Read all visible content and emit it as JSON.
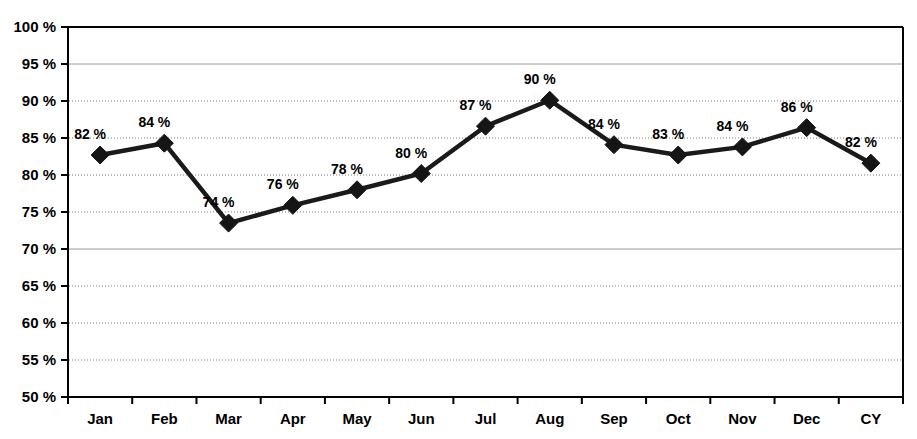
{
  "chart_data": {
    "type": "line",
    "title": "",
    "xlabel": "",
    "ylabel": "",
    "categories": [
      "Jan",
      "Feb",
      "Mar",
      "Apr",
      "May",
      "Jun",
      "Jul",
      "Aug",
      "Sep",
      "Oct",
      "Nov",
      "Dec",
      "CY"
    ],
    "values": [
      82.7,
      84.3,
      73.5,
      75.9,
      78.0,
      80.2,
      86.6,
      90.1,
      84.1,
      82.7,
      83.8,
      86.4,
      81.6
    ],
    "point_labels": [
      "82 %",
      "84 %",
      "74 %",
      "76 %",
      "78 %",
      "80 %",
      "87 %",
      "90 %",
      "84 %",
      "83 %",
      "84 %",
      "86 %",
      "82 %"
    ],
    "ylim": [
      50,
      100
    ],
    "ytick_values": [
      50,
      55,
      60,
      65,
      70,
      75,
      80,
      85,
      90,
      95,
      100
    ],
    "ytick_labels": [
      "50 %",
      "55 %",
      "60 %",
      "65 %",
      "70 %",
      "75 %",
      "80 %",
      "85 %",
      "90 %",
      "95 %",
      "100 %"
    ],
    "grid": {
      "enabled": true,
      "solid_at": [
        70,
        95
      ],
      "dotted_at": [
        55,
        60,
        65,
        75,
        80,
        85,
        90
      ],
      "solid_color": "#9a9a9a",
      "dotted_color": "#7d7d7d"
    },
    "legend": {
      "visible": false,
      "position": "none"
    },
    "series_color": "#151515",
    "marker_shape": "diamond",
    "marker_size": 9
  }
}
